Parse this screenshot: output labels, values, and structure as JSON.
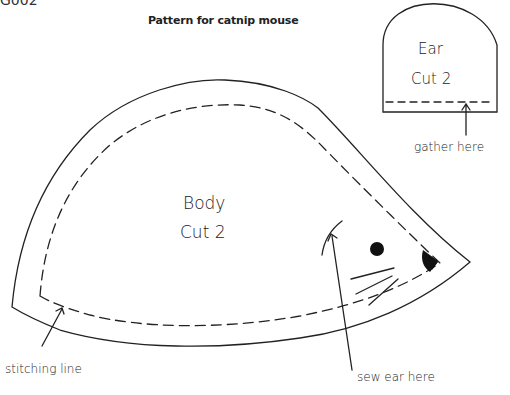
{
  "page": {
    "corner_fragment": "G002",
    "title": "Pattern for catnip mouse"
  },
  "pieces": {
    "body": {
      "label": "Body",
      "instruction": "Cut 2"
    },
    "ear": {
      "label": "Ear",
      "instruction": "Cut 2"
    }
  },
  "annotations": {
    "gather": "gather here",
    "stitching": "stitching line",
    "sew_ear": "sew ear here"
  },
  "colors": {
    "line": "#222222",
    "background": "#ffffff"
  }
}
